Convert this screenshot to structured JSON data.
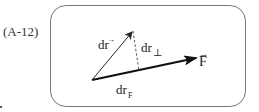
{
  "equation_label": "(A-12)",
  "diagram": {
    "vectors": [
      {
        "name": "dr",
        "label": "dr",
        "has_arrow_over": true,
        "style": "thin-solid",
        "from": [
          92,
          80
        ],
        "to": [
          133,
          31
        ]
      },
      {
        "name": "F",
        "label": "F",
        "has_arrow_over": true,
        "style": "thick-solid",
        "from": [
          92,
          80
        ],
        "to": [
          197,
          58
        ]
      },
      {
        "name": "dr_perp",
        "label": "dr",
        "subscript": "⊥",
        "style": "dashed",
        "from": [
          133,
          31
        ],
        "to": [
          139,
          71
        ]
      }
    ],
    "labels": {
      "dr": "dr",
      "dr_arrow": "→",
      "dr_perp_main": "dr",
      "dr_perp_sub": "⊥",
      "F": "F",
      "F_arrow": "→",
      "dr_F_main": "dr",
      "dr_F_sub": "F"
    },
    "colors": {
      "frame": "#777777",
      "lines": "#222222"
    }
  }
}
